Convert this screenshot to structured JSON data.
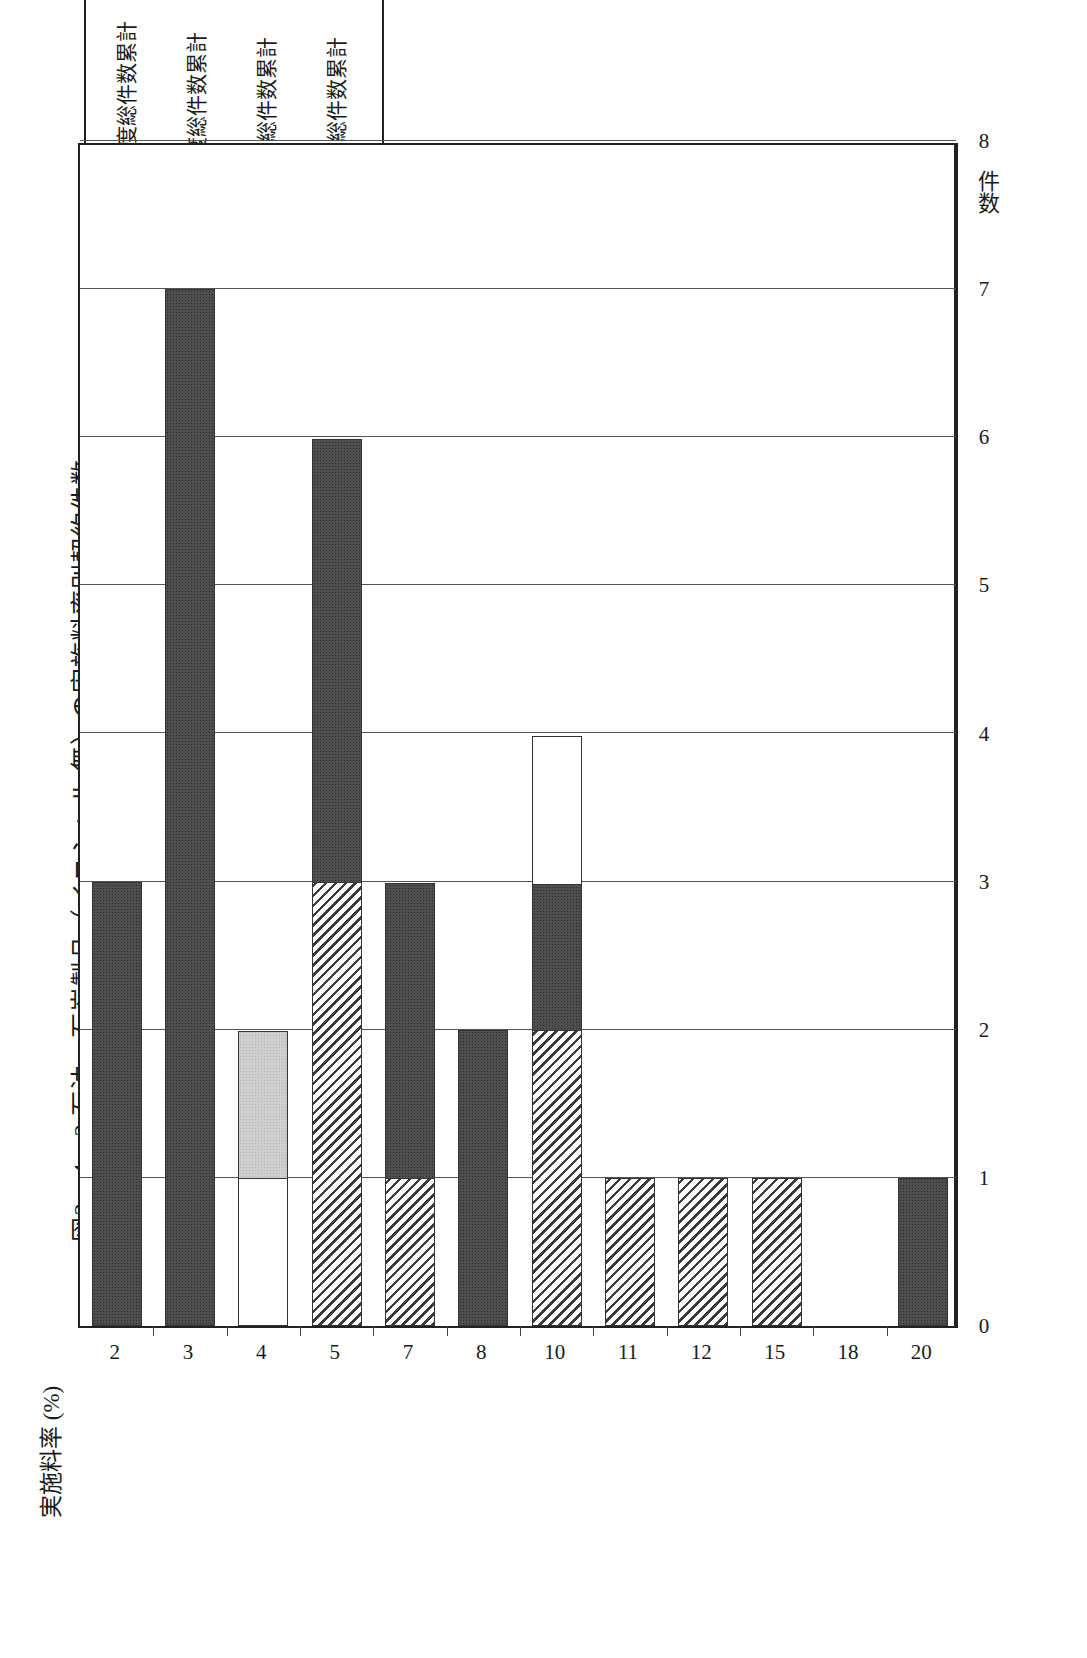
{
  "figure": {
    "title": "図2－4－2  石油・石炭製品（イニシャル 無）の実施料率別契約件数"
  },
  "legend": {
    "items": [
      {
        "swatch": "light-gray-dotted",
        "label": "平成4年度\n～平成10年度総件数累計"
      },
      {
        "swatch": "white",
        "label": "昭和63年度\n～平成3年度総件数累計"
      },
      {
        "swatch": "dark-solid",
        "label": "昭和49年\n～昭和52年  総件数累計"
      },
      {
        "swatch": "diagonal-hatch",
        "label": "昭和43年\n～昭和48年  総件数累計"
      }
    ]
  },
  "axes": {
    "value_axis_title": "件\n数",
    "category_axis_title": "実施料率 (%)",
    "value_ticks": [
      "0",
      "1",
      "2",
      "3",
      "4",
      "5",
      "6",
      "7",
      "8"
    ],
    "category_ticks": [
      "2",
      "3",
      "4",
      "5",
      "7",
      "8",
      "10",
      "11",
      "12",
      "15",
      "18",
      "20"
    ]
  },
  "chart_data": {
    "type": "bar",
    "orientation": "vertical-stacked",
    "title": "図2－4－2  石油・石炭製品（イニシャル 無）の実施料率別契約件数",
    "xlabel": "実施料率 (%)",
    "ylabel": "件数",
    "ylim": [
      0,
      8
    ],
    "grid": true,
    "legend_position": "top-right",
    "categories": [
      "2",
      "3",
      "4",
      "5",
      "7",
      "8",
      "10",
      "11",
      "12",
      "15",
      "18",
      "20"
    ],
    "series": [
      {
        "name": "昭和43年～昭和48年  総件数累計",
        "style": "diagonal-hatch",
        "values": [
          0,
          0,
          0,
          3,
          1,
          0,
          2,
          1,
          1,
          1,
          0,
          0
        ]
      },
      {
        "name": "昭和49年～昭和52年  総件数累計",
        "style": "dark-solid",
        "values": [
          3,
          7,
          0,
          3,
          2,
          2,
          1,
          0,
          0,
          0,
          0,
          1
        ]
      },
      {
        "name": "昭和63年度～平成3年度総件数累計",
        "style": "white",
        "values": [
          0,
          0,
          1,
          0,
          0,
          0,
          1,
          0,
          0,
          0,
          0,
          0
        ]
      },
      {
        "name": "平成4年度～平成10年度総件数累計",
        "style": "light-gray-dotted",
        "values": [
          0,
          0,
          1,
          0,
          0,
          0,
          0,
          0,
          0,
          0,
          0,
          0
        ]
      }
    ],
    "totals": [
      3,
      7,
      2,
      6,
      3,
      2,
      4,
      1,
      1,
      1,
      0,
      1
    ]
  },
  "colors": {
    "axis": "#222222",
    "grid": "#555555",
    "dark_fill": "#4f4f4f",
    "gray_fill": "#cfcfcf"
  }
}
